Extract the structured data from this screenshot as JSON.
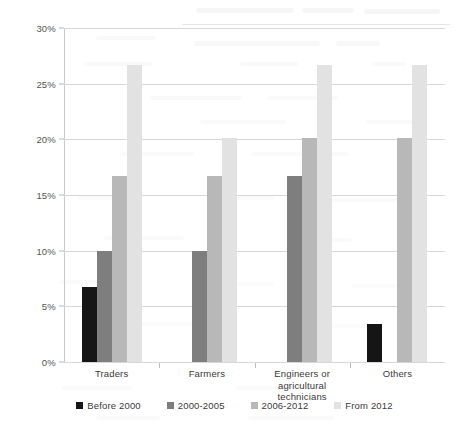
{
  "chart_data": {
    "type": "bar",
    "title": "",
    "subtitle": "",
    "xlabel": "",
    "ylabel": "",
    "categories": [
      "Traders",
      "Farmers",
      "Engineers or agricultural technicians",
      "Others"
    ],
    "series": [
      {
        "name": "Before 2000",
        "color": "#151515",
        "values": [
          6.7,
          0,
          0,
          3.4
        ]
      },
      {
        "name": "2000-2005",
        "color": "#7e7e7e",
        "values": [
          10.0,
          10.0,
          16.7,
          0
        ]
      },
      {
        "name": "2006-2012",
        "color": "#b8b8b8",
        "values": [
          16.7,
          16.7,
          20.1,
          20.1
        ]
      },
      {
        "name": "From 2012",
        "color": "#e2e2e2",
        "values": [
          26.7,
          20.1,
          26.7,
          26.7
        ]
      }
    ],
    "ylim": [
      0,
      30
    ],
    "ytick_values": [
      0,
      5,
      10,
      15,
      20,
      25,
      30
    ],
    "ytick_labels": [
      "0%",
      "5%",
      "10%",
      "15%",
      "20%",
      "25%",
      "30%"
    ],
    "grid": true,
    "legend_position": "bottom",
    "value_suffix": "%"
  },
  "legend": {
    "items": [
      {
        "label": "Before 2000",
        "color": "#151515"
      },
      {
        "label": "2000-2005",
        "color": "#7e7e7e"
      },
      {
        "label": "2006-2012",
        "color": "#b8b8b8"
      },
      {
        "label": "From 2012",
        "color": "#e2e2e2"
      }
    ]
  }
}
